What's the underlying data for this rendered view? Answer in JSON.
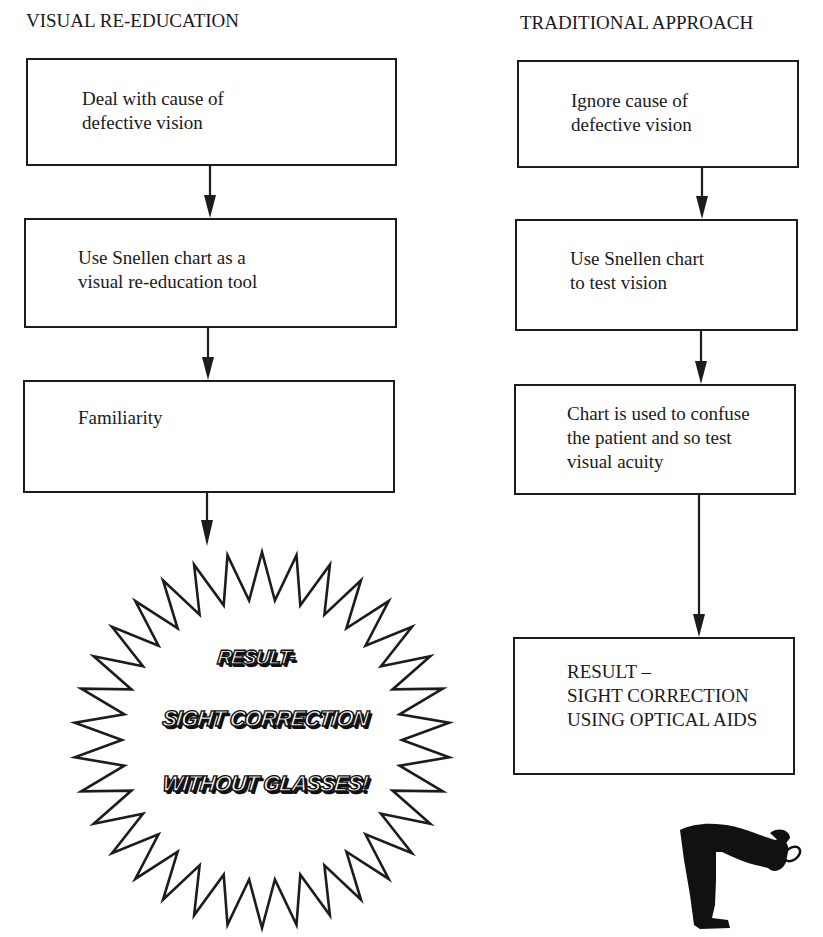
{
  "left_column": {
    "heading": "VISUAL RE-EDUCATION",
    "boxes": [
      {
        "text": "Deal with cause of\ndefective vision"
      },
      {
        "text": "Use Snellen chart as a\nvisual re-education tool"
      },
      {
        "text": "Familiarity"
      }
    ],
    "result_burst": {
      "line1": "RESULT-",
      "line2": "SIGHT CORRECTION",
      "line3": "WITHOUT GLASSES!"
    }
  },
  "right_column": {
    "heading": "TRADITIONAL APPROACH",
    "boxes": [
      {
        "text": "Ignore cause of\ndefective vision"
      },
      {
        "text": "Use Snellen chart\nto test vision"
      },
      {
        "text": "Chart is used to confuse\nthe patient and so test\nvisual acuity"
      },
      {
        "text": "RESULT –\nSIGHT CORRECTION\nUSING OPTICAL AIDS"
      }
    ]
  },
  "illustration": {
    "icon": "man-with-magnifying-glass-icon"
  },
  "colors": {
    "ink": "#1c1c1c",
    "background": "#ffffff"
  }
}
